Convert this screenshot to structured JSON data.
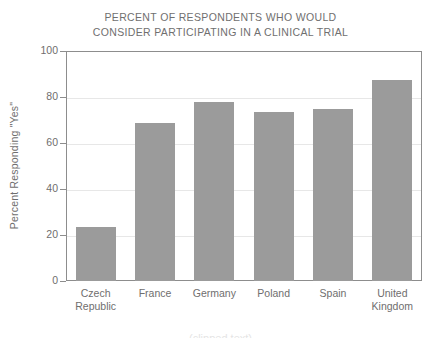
{
  "chart_data": {
    "type": "bar",
    "title": "PERCENT OF RESPONDENTS WHO WOULD CONSIDER PARTICIPATING IN A CLINICAL TRIAL",
    "title_lines": [
      "PERCENT OF RESPONDENTS WHO WOULD",
      "CONSIDER PARTICIPATING IN A CLINICAL TRIAL"
    ],
    "xlabel": "",
    "ylabel": "Percent Responding \"Yes\"",
    "categories": [
      "Czech Republic",
      "France",
      "Germany",
      "Poland",
      "Spain",
      "United Kingdom"
    ],
    "category_lines": [
      [
        "Czech",
        "Republic"
      ],
      [
        "France"
      ],
      [
        "Germany"
      ],
      [
        "Poland"
      ],
      [
        "Spain"
      ],
      [
        "United",
        "Kingdom"
      ]
    ],
    "values": [
      23.3,
      68.5,
      78.0,
      73.5,
      75.0,
      87.5
    ],
    "ylim": [
      0,
      100
    ],
    "yticks": [
      0,
      20,
      40,
      60,
      80,
      100
    ],
    "ytick_labels": [
      "0",
      "20",
      "40",
      "60",
      "80",
      "100"
    ],
    "grid": "horizontal",
    "legend": "none",
    "bar_color": "#9b9b9b",
    "axis_color": "#8d8d8d",
    "grid_color": "#e7e7e7",
    "text_color": "#6f6e6e"
  },
  "bottom_artifact": "(clipped text)"
}
